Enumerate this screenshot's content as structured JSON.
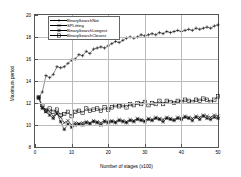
{
  "chart_data": {
    "type": "line",
    "title": "",
    "xlabel": "Number of stages (x100)",
    "ylabel": "Maximum period",
    "xlim": [
      0,
      50
    ],
    "ylim": [
      8,
      20
    ],
    "xticks": [
      0,
      10,
      20,
      30,
      40,
      50
    ],
    "yticks": [
      8,
      10,
      12,
      14,
      16,
      18,
      20
    ],
    "grid": true,
    "legend_position": "top-left",
    "x": [
      1,
      2,
      3,
      4,
      5,
      6,
      7,
      8,
      9,
      10,
      11,
      12,
      13,
      14,
      15,
      16,
      17,
      18,
      19,
      20,
      21,
      22,
      23,
      24,
      25,
      26,
      27,
      28,
      29,
      30,
      31,
      32,
      33,
      34,
      35,
      36,
      37,
      38,
      39,
      40,
      41,
      42,
      43,
      44,
      45,
      46,
      47,
      48,
      49,
      50
    ],
    "series": [
      {
        "name": "BinarySearchNot",
        "marker": "plus",
        "values": [
          12.5,
          13.0,
          14.5,
          14.3,
          14.6,
          15.3,
          15.2,
          15.3,
          15.6,
          15.9,
          16.0,
          16.4,
          16.3,
          16.7,
          16.5,
          16.9,
          17.0,
          17.1,
          17.0,
          17.2,
          17.4,
          17.6,
          17.5,
          17.7,
          17.9,
          18.0,
          17.9,
          18.0,
          18.2,
          18.1,
          18.2,
          18.3,
          18.2,
          18.4,
          18.3,
          18.5,
          18.4,
          18.5,
          18.6,
          18.5,
          18.6,
          18.7,
          18.6,
          18.8,
          18.7,
          18.8,
          18.9,
          18.8,
          19.0,
          19.1
        ]
      },
      {
        "name": "SPLitting",
        "marker": "cross",
        "values": [
          12.5,
          11.6,
          11.4,
          11.2,
          10.8,
          11.0,
          10.7,
          10.2,
          10.4,
          10.0,
          10.2,
          10.1,
          10.2,
          10.3,
          10.2,
          10.4,
          10.3,
          10.2,
          10.4,
          10.3,
          10.4,
          10.3,
          10.5,
          10.4,
          10.3,
          10.5,
          10.4,
          10.6,
          10.5,
          10.4,
          10.6,
          10.5,
          10.7,
          10.6,
          10.5,
          10.7,
          10.6,
          10.5,
          10.7,
          10.6,
          10.8,
          10.7,
          10.6,
          10.8,
          10.7,
          10.9,
          10.8,
          10.7,
          10.9,
          10.8
        ]
      },
      {
        "name": "BinarySearchLongest",
        "marker": "star",
        "values": [
          12.5,
          11.5,
          11.2,
          10.9,
          10.6,
          11.1,
          10.3,
          9.6,
          10.1,
          9.8,
          10.0,
          10.1,
          10.0,
          10.2,
          10.1,
          10.3,
          10.2,
          10.0,
          10.3,
          10.2,
          10.3,
          10.2,
          10.4,
          10.3,
          10.2,
          10.4,
          10.3,
          10.5,
          10.4,
          10.3,
          10.5,
          10.4,
          10.6,
          10.5,
          10.3,
          10.6,
          10.5,
          10.4,
          10.6,
          10.5,
          10.7,
          10.6,
          10.4,
          10.7,
          10.5,
          10.8,
          10.6,
          10.5,
          10.7,
          10.6
        ]
      },
      {
        "name": "BinarySearchClosest",
        "marker": "square",
        "values": [
          12.5,
          11.8,
          11.3,
          11.5,
          11.2,
          11.4,
          10.9,
          11.0,
          11.2,
          10.8,
          11.2,
          11.3,
          11.1,
          11.5,
          11.3,
          11.4,
          11.5,
          11.3,
          11.6,
          11.4,
          11.6,
          11.8,
          11.7,
          11.8,
          11.6,
          11.9,
          11.8,
          12.0,
          11.9,
          12.1,
          11.8,
          12.0,
          11.9,
          12.2,
          11.9,
          12.2,
          12.1,
          12.0,
          12.2,
          12.1,
          12.3,
          12.2,
          12.1,
          12.3,
          12.2,
          12.4,
          12.3,
          12.1,
          12.3,
          12.6
        ]
      }
    ]
  }
}
